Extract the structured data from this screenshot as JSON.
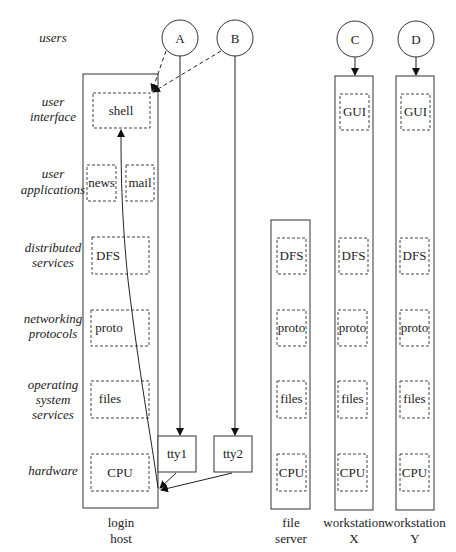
{
  "layers": [
    {
      "id": "users",
      "lines": [
        "users"
      ]
    },
    {
      "id": "user-interface",
      "lines": [
        "user",
        "interface"
      ]
    },
    {
      "id": "user-applications",
      "lines": [
        "user",
        "applications"
      ]
    },
    {
      "id": "distributed-services",
      "lines": [
        "distributed",
        "services"
      ]
    },
    {
      "id": "networking-protocols",
      "lines": [
        "networking",
        "protocols"
      ]
    },
    {
      "id": "operating-system-services",
      "lines": [
        "operating",
        "system",
        "services"
      ]
    },
    {
      "id": "hardware",
      "lines": [
        "hardware"
      ]
    }
  ],
  "users": {
    "a": "A",
    "b": "B",
    "c": "C",
    "d": "D"
  },
  "login_host": {
    "caption": [
      "login",
      "host"
    ],
    "components": {
      "shell": "shell",
      "news": "news",
      "mail": "mail",
      "dfs": "DFS",
      "proto": "proto",
      "files": "files",
      "cpu": "CPU"
    }
  },
  "terminals": {
    "tty1": "tty1",
    "tty2": "tty2"
  },
  "file_server": {
    "caption": [
      "file",
      "server"
    ],
    "components": {
      "dfs": "DFS",
      "proto": "proto",
      "files": "files",
      "cpu": "CPU"
    }
  },
  "workstation_x": {
    "caption": [
      "workstation",
      "X"
    ],
    "components": {
      "gui": "GUI",
      "dfs": "DFS",
      "proto": "proto",
      "files": "files",
      "cpu": "CPU"
    }
  },
  "workstation_y": {
    "caption": [
      "workstation",
      "Y"
    ],
    "components": {
      "gui": "GUI",
      "dfs": "DFS",
      "proto": "proto",
      "files": "files",
      "cpu": "CPU"
    }
  }
}
